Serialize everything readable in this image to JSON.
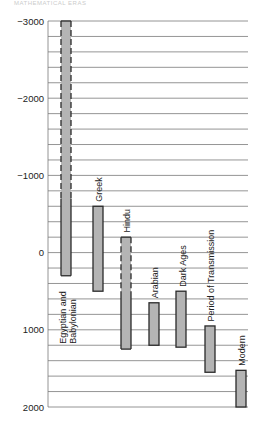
{
  "header": {
    "text": "MATHEMATICAL ERAS"
  },
  "chart_data": {
    "type": "bar",
    "subtype": "floating-range",
    "orientation": "vertical",
    "title": "",
    "xlabel": "",
    "ylabel": "",
    "ylim": [
      -3000,
      2000
    ],
    "y_inverted": true,
    "yticks": [
      -3000,
      -2000,
      -1000,
      0,
      1000,
      2000
    ],
    "ytick_labels": [
      "−3000",
      "−2000",
      "−1000",
      "0",
      "1000",
      "2000"
    ],
    "grid_step": 200,
    "grid": true,
    "legend": "none",
    "categories": [
      "Egyptian and Babylonian",
      "Greek",
      "Hindu",
      "Arabian",
      "Dark Ages",
      "Period of Transmission",
      "Modern"
    ],
    "series": [
      {
        "name": "era",
        "ranges": [
          {
            "label": "Egyptian and Babylonian",
            "start": -3000,
            "end": 300,
            "dashed_until": -700,
            "label_lines": [
              "Egyptian and",
              "Babylonian"
            ]
          },
          {
            "label": "Greek",
            "start": -600,
            "end": 500,
            "dashed_until": null,
            "label_lines": [
              "Greek"
            ]
          },
          {
            "label": "Hindu",
            "start": -200,
            "end": 1250,
            "dashed_until": 500,
            "label_lines": [
              "Hindu"
            ]
          },
          {
            "label": "Arabian",
            "start": 650,
            "end": 1200,
            "dashed_until": null,
            "label_lines": [
              "Arabian"
            ]
          },
          {
            "label": "Dark Ages",
            "start": 500,
            "end": 1225,
            "dashed_until": null,
            "label_lines": [
              "Dark Ages"
            ]
          },
          {
            "label": "Period of Transmission",
            "start": 950,
            "end": 1550,
            "dashed_until": null,
            "label_lines": [
              "Period of Transmission"
            ]
          },
          {
            "label": "Modern",
            "start": 1525,
            "end": 2000,
            "dashed_until": null,
            "label_lines": [
              "Modern"
            ]
          }
        ]
      }
    ]
  },
  "colors": {
    "bar_fill": "#b4b4b4",
    "bar_stroke": "#2a2a2a",
    "grid": "#7a7a7a",
    "text": "#222222"
  }
}
